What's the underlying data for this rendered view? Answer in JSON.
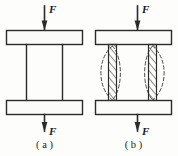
{
  "figure": {
    "type": "engineering-diagram",
    "width_px": 178,
    "height_px": 156,
    "background_color": "#fdfdfc",
    "line_color": "#2b2b2b",
    "dashed_color": "#4a4a4a",
    "plate_fill": "#fbfbfa"
  },
  "panels": [
    {
      "id": "a",
      "caption": "( a )",
      "description": "straight column between two rigid plates",
      "forces": [
        {
          "id": "top",
          "label": "F",
          "direction": "down"
        },
        {
          "id": "bottom",
          "label": "F",
          "direction": "down"
        }
      ],
      "members": [
        {
          "type": "plate",
          "position": "top"
        },
        {
          "type": "plate",
          "position": "bottom"
        },
        {
          "type": "column",
          "style": "plain",
          "count": 2
        }
      ]
    },
    {
      "id": "b",
      "caption": "( b )",
      "description": "buckled column shown with hatched members and dashed deflection curves",
      "forces": [
        {
          "id": "top",
          "label": "F",
          "direction": "down"
        },
        {
          "id": "bottom",
          "label": "F",
          "direction": "down"
        }
      ],
      "members": [
        {
          "type": "plate",
          "position": "top"
        },
        {
          "type": "plate",
          "position": "bottom"
        },
        {
          "type": "column",
          "style": "hatched",
          "count": 2
        },
        {
          "type": "deflection-curve",
          "style": "dashed",
          "count": 4
        }
      ]
    }
  ]
}
